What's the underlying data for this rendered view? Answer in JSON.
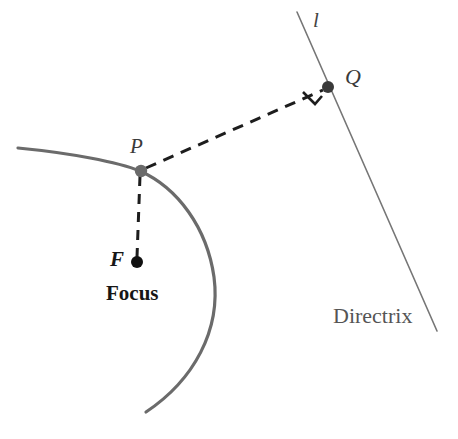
{
  "figure": {
    "background_color": "#ffffff",
    "width": 458,
    "height": 439
  },
  "labels": {
    "line_l": "l",
    "point_q": "Q",
    "point_p": "P",
    "point_f": "F",
    "focus_caption": "Focus",
    "directrix_caption": "Directrix"
  },
  "colors": {
    "curve": "#6b6b6b",
    "directrix_line": "#767676",
    "dashed_segment": "#1d1d1d",
    "point_p_dot": "#6a6a6a",
    "point_q_dot": "#3a3a3a",
    "point_f_dot": "#111111",
    "right_angle_marker": "#1d1d1d",
    "label_dark": "#161616",
    "label_gray": "#555555"
  },
  "geometry": {
    "type": "parabola-focus-directrix",
    "parabola": {
      "description": "Left-opening parabola arc passing through P",
      "path": "M 18 148 C 70 153, 118 162, 140 171 C 178 188, 207 228, 214 277 C 221 330, 194 380, 146 412",
      "stroke_width": 3.2
    },
    "directrix": {
      "description": "Straight line through Q labeled l / Directrix",
      "x1": 297,
      "y1": 12,
      "x2": 437,
      "y2": 331,
      "stroke_width": 1.6
    },
    "point_p": {
      "x": 141,
      "y": 171,
      "r": 6.2
    },
    "point_q": {
      "x": 328,
      "y": 87,
      "r": 6.0
    },
    "point_f": {
      "x": 137,
      "y": 262,
      "r": 6.0
    },
    "segment_pq": {
      "x1": 146,
      "y1": 168,
      "x2": 323,
      "y2": 90,
      "dash": "11 8",
      "stroke_width": 3.0
    },
    "segment_pf": {
      "x1": 140,
      "y1": 176,
      "x2": 137,
      "y2": 257,
      "dash": "10 8",
      "stroke_width": 3.0
    },
    "right_angle_marker": {
      "description": "Small square bracket indicating PQ is perpendicular to directrix",
      "path": "M 303 92 L 315 104 L 322 96",
      "stroke_width": 2.6
    }
  }
}
